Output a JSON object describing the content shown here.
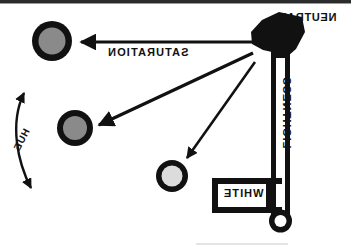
{
  "figure": {
    "background_color": "#ffffff",
    "ink_color": "#111111",
    "scan_artifact_top_band_color": "#2b2b2b"
  },
  "labels": {
    "neutral": "NEUTRAL",
    "saturation": "SATURATION",
    "lightness": "LIGHTNESS",
    "white": "WHITE",
    "hue": "HUE"
  },
  "axis": {
    "name": "lightness-axis",
    "orientation": "vertical",
    "top_marker": "neutral-blob",
    "bottom_marker": "white-bulb",
    "bar_color": "#111111",
    "bulb_fill": "#ffffff"
  },
  "white_box": {
    "label": "WHITE",
    "border_color": "#111111",
    "fill": "#ffffff"
  },
  "samples": [
    {
      "id": "sample-1",
      "name": "high-saturation-swatch",
      "fill": "#8a8a8a",
      "ring_color": "#111111",
      "cx": 52,
      "cy": 41,
      "r": 20,
      "ring_width": 7
    },
    {
      "id": "sample-2",
      "name": "mid-saturation-swatch",
      "fill": "#8a8a8a",
      "ring_color": "#111111",
      "cx": 75,
      "cy": 128,
      "r": 18,
      "ring_width": 7
    },
    {
      "id": "sample-3",
      "name": "low-saturation-swatch",
      "fill": "#dcdcdc",
      "ring_color": "#111111",
      "cx": 172,
      "cy": 176,
      "r": 16,
      "ring_width": 7
    }
  ],
  "arrows": [
    {
      "id": "arrow-saturation",
      "name": "saturation-arrow",
      "from": "neutral-blob",
      "to": "sample-1",
      "direction": "leftward-horizontal",
      "label": "SATURATION"
    },
    {
      "id": "arrow-sample-2",
      "name": "saturation-arrow-mid",
      "from": "neutral-blob",
      "to": "sample-2",
      "direction": "diagonal-down-left"
    },
    {
      "id": "arrow-sample-3",
      "name": "saturation-arrow-low",
      "from": "neutral-blob",
      "to": "sample-3",
      "direction": "diagonal-down-left"
    },
    {
      "id": "arrow-hue",
      "name": "hue-arc-arrow",
      "style": "curved-double-headed",
      "label": "HUE"
    }
  ]
}
